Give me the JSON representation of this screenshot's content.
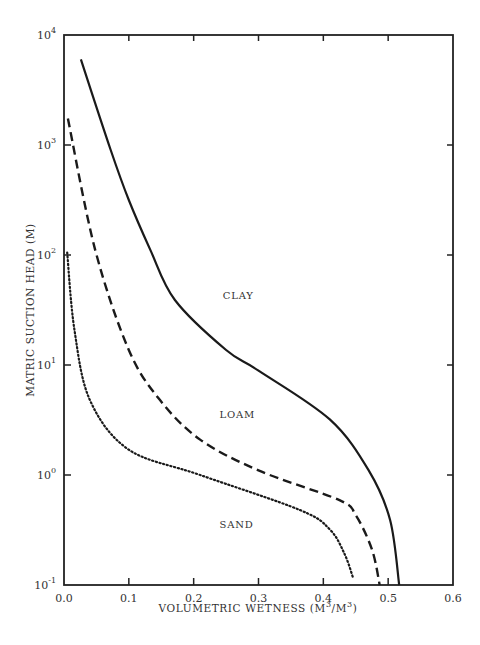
{
  "chart_data": {
    "type": "line",
    "title": "",
    "xlabel": "VOLUMETRIC WETNESS (M³/M³)",
    "ylabel": "MATRIC SUCTION HEAD (M)",
    "xlim": [
      0.0,
      0.6
    ],
    "ylim": [
      0.1,
      10000
    ],
    "yscale": "log",
    "grid": false,
    "legend": "inline labels",
    "x_ticks": [
      "0.0",
      "0.1",
      "0.2",
      "0.3",
      "0.4",
      "0.5",
      "0.6"
    ],
    "y_ticks": [
      {
        "base": "10",
        "exp": "-1"
      },
      {
        "base": "10",
        "exp": "0"
      },
      {
        "base": "10",
        "exp": "1"
      },
      {
        "base": "10",
        "exp": "2"
      },
      {
        "base": "10",
        "exp": "3"
      },
      {
        "base": "10",
        "exp": "4"
      }
    ],
    "series": [
      {
        "name": "CLAY",
        "style": "solid",
        "x": [
          0.026,
          0.072,
          0.1,
          0.133,
          0.171,
          0.25,
          0.3,
          0.41,
          0.47,
          0.503,
          0.517
        ],
        "y": [
          6000,
          900,
          316,
          112,
          39,
          13.7,
          8.9,
          3.2,
          1.1,
          0.39,
          0.1
        ]
      },
      {
        "name": "LOAM",
        "style": "dashed",
        "x": [
          0.006,
          0.048,
          0.1,
          0.148,
          0.21,
          0.3,
          0.425,
          0.45,
          0.475,
          0.487
        ],
        "y": [
          1740,
          112,
          13.7,
          4.8,
          2.1,
          1.1,
          0.59,
          0.43,
          0.21,
          0.1
        ]
      },
      {
        "name": "SAND",
        "style": "dotted",
        "x": [
          0.005,
          0.016,
          0.04,
          0.1,
          0.21,
          0.364,
          0.41,
          0.433,
          0.446
        ],
        "y": [
          105,
          21,
          4.8,
          1.7,
          1.0,
          0.48,
          0.32,
          0.19,
          0.115
        ]
      }
    ],
    "annotations": [
      {
        "text": "CLAY",
        "x": 0.245,
        "y": 40
      },
      {
        "text": "LOAM",
        "x": 0.24,
        "y": 3.3
      },
      {
        "text": "SAND",
        "x": 0.24,
        "y": 0.33
      }
    ]
  },
  "labels": {
    "xlabel_main": "VOLUMETRIC WETNESS (M",
    "xlabel_sup1": "3",
    "xlabel_mid": "/M",
    "xlabel_sup2": "3",
    "xlabel_end": ")",
    "ylabel": "MATRIC SUCTION HEAD (M)"
  }
}
